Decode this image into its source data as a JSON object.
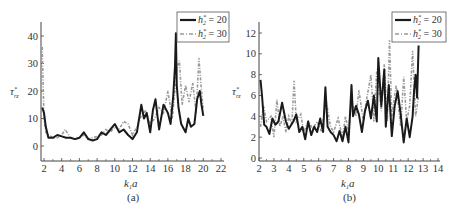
{
  "chart_data": [
    {
      "type": "line",
      "panel": "(a)",
      "caption": "(a)",
      "xlabel": "k₁a",
      "ylabel": "τ*_rz",
      "xlim": [
        1.8,
        22
      ],
      "ylim": [
        -5,
        46
      ],
      "xticks": [
        2,
        4,
        6,
        8,
        10,
        12,
        14,
        16,
        18,
        20,
        22
      ],
      "yticks": [
        0,
        10,
        20,
        30,
        40
      ],
      "grid": false,
      "legend_position": "upper right",
      "legend": [
        "h₂* = 20",
        "h₂* = 30"
      ],
      "series": [
        {
          "name": "h₂* = 20",
          "style": "solid-black",
          "x": [
            1.8,
            2.0,
            2.2,
            2.5,
            3,
            3.5,
            4,
            4.5,
            5,
            5.5,
            6,
            6.5,
            7,
            7.5,
            8,
            8.5,
            9,
            9.5,
            10,
            10.5,
            11,
            11.5,
            12,
            12.5,
            13,
            13.3,
            13.6,
            14,
            14.3,
            14.6,
            15,
            15.5,
            16,
            16.3,
            16.6,
            16.8,
            16.9,
            17.0,
            17.2,
            17.5,
            18,
            18.3,
            18.6,
            19,
            19.3,
            19.6,
            19.8,
            20
          ],
          "values": [
            14,
            12,
            7,
            3,
            3,
            4,
            3.5,
            3,
            3,
            2.5,
            3,
            5,
            2.5,
            2,
            2.5,
            5,
            4,
            6,
            8,
            5,
            6,
            4,
            2.5,
            5,
            15,
            10,
            12,
            5,
            13,
            17,
            6,
            15,
            12,
            8,
            18,
            29,
            41,
            22,
            14,
            8,
            5,
            10,
            7,
            8,
            17,
            20,
            15,
            11
          ]
        },
        {
          "name": "h₂* = 30",
          "style": "dash-dot-gray",
          "x": [
            1.8,
            2.0,
            2.2,
            2.5,
            3,
            3.5,
            4,
            4.4,
            5,
            5.5,
            6,
            6.5,
            7,
            7.5,
            8,
            8.5,
            9,
            9.5,
            10,
            10.5,
            11,
            11.5,
            12,
            12.5,
            13,
            13.5,
            14,
            14.5,
            15,
            15.5,
            16,
            16.5,
            17,
            17.3,
            17.6,
            18,
            18.4,
            18.8,
            19.2,
            19.5,
            19.8,
            20
          ],
          "values": [
            36,
            10,
            5,
            4,
            3,
            3,
            4,
            6,
            3,
            2.5,
            3,
            4,
            2.5,
            3,
            3.5,
            4,
            6,
            5,
            7,
            6,
            9,
            8,
            4,
            7,
            11,
            13,
            8,
            10,
            14,
            12,
            20,
            10,
            28,
            31,
            15,
            22,
            16,
            23,
            12,
            32,
            20,
            13
          ]
        }
      ]
    },
    {
      "type": "line",
      "panel": "(b)",
      "caption": "(b)",
      "xlabel": "k₁a",
      "ylabel": "τ*_rz",
      "xlim": [
        2,
        14
      ],
      "ylim": [
        0,
        13
      ],
      "xticks": [
        2,
        3,
        4,
        5,
        6,
        7,
        8,
        9,
        10,
        11,
        12,
        13,
        14
      ],
      "yticks": [
        0,
        2,
        4,
        6,
        8,
        10,
        12
      ],
      "grid": false,
      "legend_position": "upper right",
      "legend": [
        "h₂* = 20",
        "h₂* = 30"
      ],
      "series": [
        {
          "name": "h₂* = 20",
          "style": "solid-black",
          "x": [
            2.1,
            2.2,
            2.35,
            2.5,
            2.7,
            2.9,
            3.1,
            3.3,
            3.55,
            3.8,
            4.0,
            4.3,
            4.5,
            4.7,
            4.9,
            5.1,
            5.3,
            5.5,
            5.7,
            5.9,
            6.1,
            6.3,
            6.45,
            6.6,
            6.8,
            7.0,
            7.2,
            7.4,
            7.6,
            7.8,
            8.0,
            8.2,
            8.3,
            8.5,
            8.7,
            8.9,
            9.1,
            9.3,
            9.5,
            9.7,
            9.9,
            10.0,
            10.2,
            10.4,
            10.5,
            10.7,
            10.9,
            11.1,
            11.3,
            11.5,
            11.7,
            11.9,
            12.1,
            12.3,
            12.4,
            12.5,
            12.6,
            12.7
          ],
          "values": [
            7.5,
            6,
            3.2,
            3,
            2.3,
            3.8,
            3.2,
            3.5,
            5.3,
            3.5,
            2.8,
            3.5,
            4.2,
            2.5,
            3,
            1.8,
            3.5,
            2.2,
            3,
            2.5,
            3.8,
            2.5,
            6.8,
            3,
            2.5,
            2.2,
            1.6,
            2.6,
            1.6,
            3,
            1.5,
            7,
            4,
            5,
            4.2,
            2.5,
            4.5,
            5.5,
            3.8,
            6,
            3.5,
            9.6,
            5,
            8.5,
            3,
            7,
            2.1,
            5,
            6.4,
            4.2,
            1.5,
            3.8,
            2,
            4,
            6.5,
            8,
            5.8,
            10.8
          ]
        },
        {
          "name": "h₂* = 30",
          "style": "dash-dot-gray",
          "x": [
            2.1,
            2.3,
            2.5,
            2.8,
            3.0,
            3.2,
            3.4,
            3.6,
            3.8,
            4.0,
            4.2,
            4.35,
            4.5,
            4.8,
            5.0,
            5.3,
            5.6,
            5.9,
            6.2,
            6.5,
            6.8,
            7.0,
            7.3,
            7.6,
            7.8,
            8.0,
            8.2,
            8.5,
            8.7,
            9.0,
            9.2,
            9.5,
            9.7,
            9.9,
            10.2,
            10.4,
            10.6,
            10.75,
            10.9,
            11.2,
            11.5,
            11.7,
            11.9,
            12.1,
            12.3,
            12.5,
            12.7
          ],
          "values": [
            3,
            5,
            3.5,
            4,
            2,
            5.6,
            3,
            4,
            2.5,
            4,
            3.2,
            7.4,
            3.5,
            4.2,
            2.5,
            3.5,
            2.8,
            3.5,
            2.5,
            5.5,
            3,
            2.5,
            3.8,
            2,
            4,
            2.5,
            5.5,
            4,
            6.5,
            3.5,
            5.5,
            8,
            3.5,
            8.5,
            4.5,
            9,
            3.5,
            11.3,
            4,
            7,
            3,
            7.8,
            3.5,
            5,
            10.3,
            4,
            6
          ]
        }
      ]
    }
  ],
  "panel_a": {
    "caption": "(a)",
    "xlabel_main": "k",
    "xlabel_sub": "1",
    "xlabel_tail": "a",
    "ylabel_main": "τ",
    "ylabel_sup": "*",
    "ylabel_sub": "rz",
    "legend": [
      {
        "label_main": "h",
        "label_sup": "*",
        "label_sub": "2",
        "label_value": " = 20"
      },
      {
        "label_main": "h",
        "label_sup": "*",
        "label_sub": "2",
        "label_value": " = 30"
      }
    ]
  },
  "panel_b": {
    "caption": "(b)",
    "xlabel_main": "k",
    "xlabel_sub": "1",
    "xlabel_tail": "a",
    "ylabel_main": "τ",
    "ylabel_sup": "*",
    "ylabel_sub": "rz",
    "legend": [
      {
        "label_main": "h",
        "label_sup": "*",
        "label_sub": "2",
        "label_value": " = 20"
      },
      {
        "label_main": "h",
        "label_sup": "*",
        "label_sub": "2",
        "label_value": " = 30"
      }
    ]
  },
  "colors": {
    "series1": "#1a1a1a",
    "series2": "#9a9a9a",
    "axis": "#444444"
  }
}
